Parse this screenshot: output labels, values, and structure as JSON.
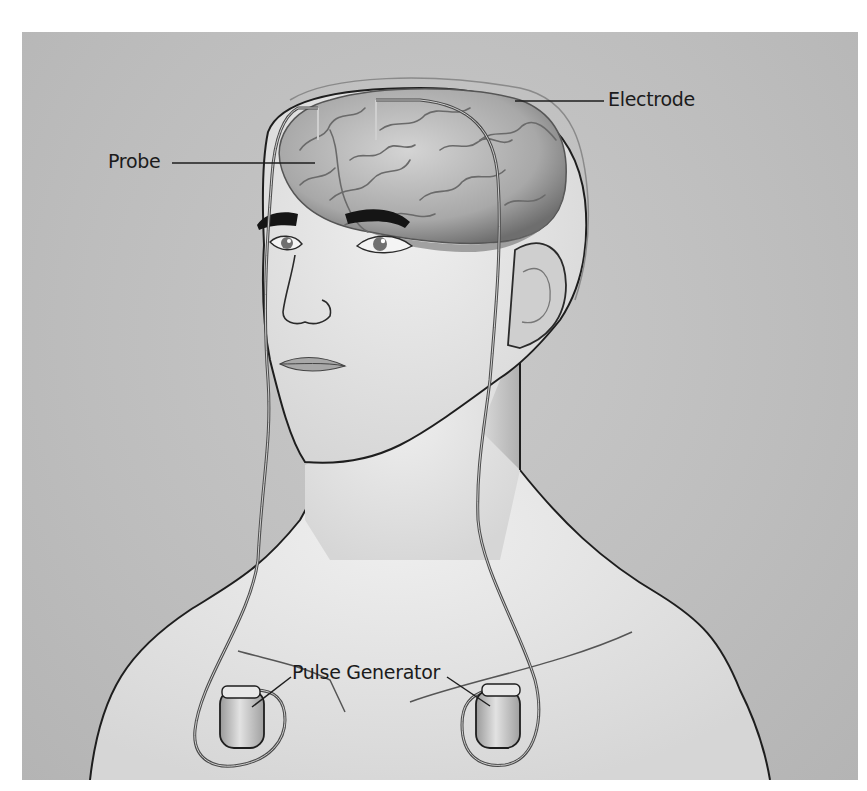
{
  "figure": {
    "labels": {
      "electrode": "Electrode",
      "probe": "Probe",
      "pulse_generator": "Pulse Generator"
    },
    "colors": {
      "background": "#bfbfbf",
      "skin": "#e4e4e4",
      "outline": "#1e1e1e",
      "brain": "#a9a9a9",
      "lead": "#555555",
      "page": "#ffffff"
    }
  }
}
